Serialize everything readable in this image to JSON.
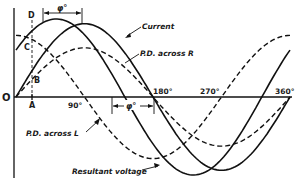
{
  "diagram": {
    "axis": {
      "origin_label": "O",
      "tick_labels": [
        "90°",
        "180°",
        "270°",
        "360°"
      ],
      "point_labels": {
        "A": "A",
        "B": "B",
        "C": "C",
        "D": "D"
      }
    },
    "phase_angle_label": "φ°",
    "curves": [
      {
        "name": "Current",
        "style": "solid",
        "phase_deg": 0,
        "relative_amplitude": 0.94
      },
      {
        "name": "Resultant voltage",
        "style": "solid",
        "phase_deg": 37,
        "relative_amplitude": 1.0
      },
      {
        "name": "P.D. across R",
        "style": "dashed",
        "phase_deg": 0,
        "relative_amplitude": 0.63
      },
      {
        "name": "P.D. across L",
        "style": "dashed",
        "phase_deg": 90,
        "relative_amplitude": 0.79
      }
    ],
    "labels": {
      "current": "Current",
      "pd_r": "P.D. across  R",
      "pd_l": "P.D. across L",
      "resultant": "Resultant voltage"
    },
    "colors": {
      "ink": "#111111",
      "background": "#ffffff"
    }
  }
}
